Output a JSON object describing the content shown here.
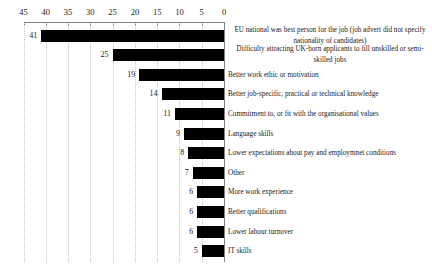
{
  "chart_data": {
    "type": "bar",
    "orientation": "horizontal",
    "title": "",
    "xlabel": "",
    "ylabel": "",
    "categories": [
      "EU national was best person for the job (job advert did not specify nationality of candidates)",
      "Difficulty attracting UK-born applicants to fill unskilled or semi-skilled jobs",
      "Better work ethic or motivation",
      "Better job-specific, practical or technical knowledge",
      "Commitment to, or fit with the organisational values",
      "Language skills",
      "Lower expectations about pay and employmnet conditions",
      "Other",
      "More work experience",
      "Better qualifications",
      "Lower labour turnover",
      "IT skills"
    ],
    "values": [
      41,
      25,
      19,
      14,
      11,
      9,
      8,
      7,
      6,
      6,
      6,
      5
    ],
    "value_labels_shown": true,
    "xlim": [
      45,
      0
    ],
    "x_ticks": [
      45,
      40,
      35,
      30,
      25,
      20,
      15,
      10,
      5,
      0
    ],
    "value_axis_position": "top",
    "axis_reversed": true,
    "grid": "dotted-vertical",
    "legend": "none",
    "bar_color": "#000000",
    "gridline_color": "#c4c4c4",
    "axis_color": "#808080",
    "text_color": "#1a1a1a",
    "background_color": "#ffffff"
  }
}
